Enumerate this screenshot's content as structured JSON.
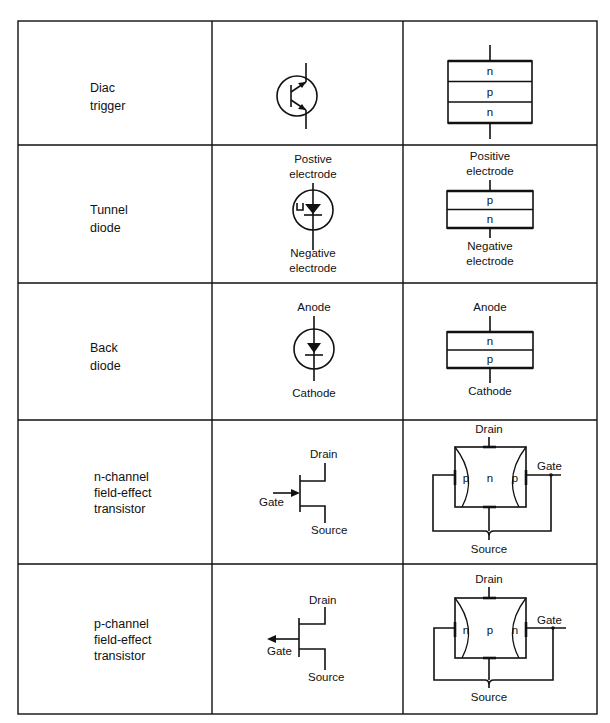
{
  "table": {
    "rows": [
      {
        "name_lines": [
          "Diac",
          "trigger"
        ],
        "symbol": "diac-symbol",
        "structure": {
          "layers": [
            "n",
            "p",
            "n"
          ]
        }
      },
      {
        "name_lines": [
          "Tunnel",
          "diode"
        ],
        "symbol": "tunnel-diode-symbol",
        "symbol_labels": {
          "top": [
            "Postive",
            "electrode"
          ],
          "bottom": [
            "Negative",
            "electrode"
          ]
        },
        "structure": {
          "top": [
            "Positive",
            "electrode"
          ],
          "layers": [
            "p",
            "n"
          ],
          "bottom": [
            "Negative",
            "electrode"
          ]
        }
      },
      {
        "name_lines": [
          "Back",
          "diode"
        ],
        "symbol": "back-diode-symbol",
        "symbol_labels": {
          "top": "Anode",
          "bottom": "Cathode"
        },
        "structure": {
          "top": "Anode",
          "layers": [
            "n",
            "p"
          ],
          "bottom": "Cathode"
        }
      },
      {
        "name_lines": [
          "n-channel",
          "field-effect",
          "transistor"
        ],
        "symbol": "n-channel-fet-symbol",
        "symbol_labels": {
          "drain": "Drain",
          "gate": "Gate",
          "source": "Source"
        },
        "structure": {
          "drain": "Drain",
          "gate": "Gate",
          "source": "Source",
          "side": "p",
          "channel": "n"
        }
      },
      {
        "name_lines": [
          "p-channel",
          "field-effect",
          "transistor"
        ],
        "symbol": "p-channel-fet-symbol",
        "symbol_labels": {
          "drain": "Drain",
          "gate": "Gate",
          "source": "Source"
        },
        "structure": {
          "drain": "Drain",
          "gate": "Gate",
          "source": "Source",
          "side": "n",
          "channel": "p"
        }
      }
    ]
  }
}
